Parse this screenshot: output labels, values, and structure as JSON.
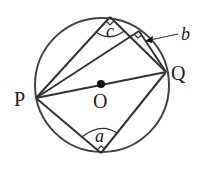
{
  "diagram": {
    "type": "circle-geometry",
    "stroke_color": "#3a3a3a",
    "points": {
      "P": {
        "label": "P",
        "x": 36,
        "y": 98
      },
      "Q": {
        "label": "Q",
        "x": 166,
        "y": 72
      },
      "O": {
        "label": "O",
        "x": 101,
        "y": 84
      },
      "C": {
        "x": 110,
        "y": 17
      },
      "B": {
        "x": 139,
        "y": 31
      },
      "A": {
        "x": 101,
        "y": 153
      }
    },
    "angle_labels": {
      "a": "a",
      "b": "b",
      "c": "c"
    },
    "circle": {
      "cx": 102,
      "cy": 85,
      "r": 67
    }
  }
}
